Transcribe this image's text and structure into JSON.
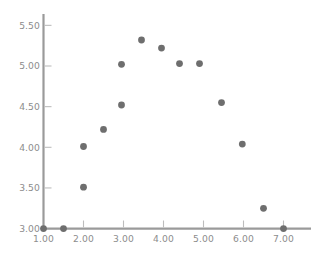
{
  "chart_data": {
    "type": "scatter",
    "title": "",
    "subtitle": "",
    "xlabel": "",
    "ylabel": "",
    "xlim": [
      1.0,
      7.35
    ],
    "ylim": [
      3.0,
      5.62
    ],
    "grid": false,
    "legend": null,
    "xticks": [
      1.0,
      2.0,
      3.0,
      4.0,
      5.0,
      6.0,
      7.0
    ],
    "xtick_labels": [
      "1.00",
      "2.00",
      "3.00",
      "4.00",
      "5.00",
      "6.00",
      "7.00"
    ],
    "yticks": [
      3.0,
      3.5,
      4.0,
      4.5,
      5.0,
      5.5
    ],
    "ytick_labels": [
      "3.00",
      "3.50",
      "4.00",
      "4.50",
      "5.00",
      "5.50"
    ],
    "series": [
      {
        "name": "points",
        "marker": "circle",
        "color": "#6e6e6e",
        "points": [
          {
            "x": 1.0,
            "y": 3.0
          },
          {
            "x": 1.5,
            "y": 3.0
          },
          {
            "x": 2.0,
            "y": 3.51
          },
          {
            "x": 2.0,
            "y": 4.01
          },
          {
            "x": 2.5,
            "y": 4.22
          },
          {
            "x": 2.95,
            "y": 4.52
          },
          {
            "x": 2.95,
            "y": 5.02
          },
          {
            "x": 3.45,
            "y": 5.32
          },
          {
            "x": 3.95,
            "y": 5.22
          },
          {
            "x": 4.4,
            "y": 5.03
          },
          {
            "x": 4.9,
            "y": 5.03
          },
          {
            "x": 5.45,
            "y": 4.55
          },
          {
            "x": 5.97,
            "y": 4.04
          },
          {
            "x": 6.5,
            "y": 3.25
          },
          {
            "x": 7.0,
            "y": 3.0
          }
        ]
      }
    ]
  },
  "style": {
    "axis_color": "#9a9a9a",
    "tick_color": "#bdbdbd",
    "label_color": "#8d8d8d",
    "marker_color": "#6e6e6e",
    "background": "#ffffff",
    "marker_radius_px": 3.4
  }
}
